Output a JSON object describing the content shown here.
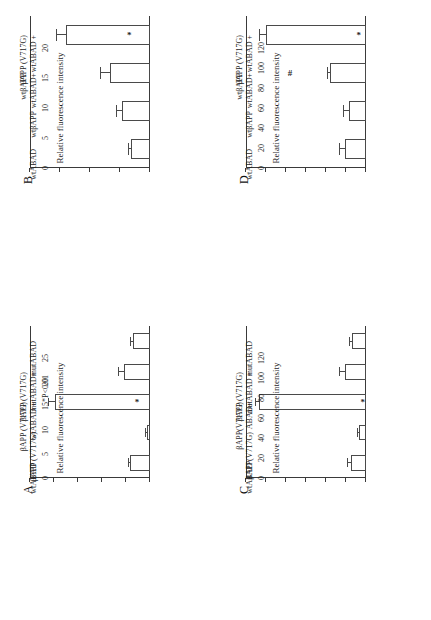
{
  "figure": {
    "orientation": "rotated-90",
    "ylabel": "Relative fluorescence intensity",
    "significance_note": "*P<0.01",
    "panel_letters": {
      "a": "A",
      "b": "B",
      "c": "C",
      "d": "D"
    }
  },
  "chart_data": [
    {
      "id": "A",
      "type": "bar",
      "title": "A",
      "xlabel": "",
      "ylabel": "Relative fluorescence intensity",
      "ylim": [
        0,
        25
      ],
      "yticks": [
        0,
        5,
        10,
        15,
        20,
        25
      ],
      "ytick_labels": [
        "0",
        "5",
        "10",
        "15",
        "20",
        "25"
      ],
      "grid": false,
      "legend": "none",
      "annotations": [
        "*P<0.01"
      ],
      "categories": [
        "wtABAD",
        "βAPP (V717G)",
        "wtABAD +\nβAPP (V717G)",
        "mutABAD+\nβAPP (V717G)",
        "mutABAD"
      ],
      "values": [
        4.2,
        0.7,
        19.8,
        5.4,
        3.6
      ],
      "errors": [
        0.25,
        0.2,
        1.2,
        1.0,
        0.35
      ],
      "markers": [
        "",
        "",
        "*",
        "",
        ""
      ]
    },
    {
      "id": "B",
      "type": "bar",
      "title": "B",
      "xlabel": "",
      "ylabel": "Relative fluorescence intensity",
      "ylim": [
        0,
        20
      ],
      "yticks": [
        0,
        5,
        10,
        15,
        20
      ],
      "ytick_labels": [
        "0",
        "5",
        "10",
        "15",
        "20"
      ],
      "grid": false,
      "legend": "none",
      "annotations": [],
      "categories": [
        "wtABAD",
        "wtβAPP",
        "wtABAD+\nwtβAPP",
        "wtABAD +\nβAPP (V717G)"
      ],
      "values": [
        3.2,
        4.6,
        6.6,
        14.0
      ],
      "errors": [
        0.25,
        0.9,
        1.6,
        1.5
      ],
      "markers": [
        "",
        "",
        "",
        "*"
      ]
    },
    {
      "id": "C",
      "type": "bar",
      "title": "C",
      "xlabel": "",
      "ylabel": "Relative fluorescence intensity",
      "ylim": [
        0,
        120
      ],
      "yticks": [
        0,
        20,
        40,
        60,
        80,
        100,
        120
      ],
      "ytick_labels": [
        "0",
        "20",
        "40",
        "60",
        "80",
        "100",
        "120"
      ],
      "grid": false,
      "legend": "none",
      "annotations": [],
      "categories": [
        "wtABAD",
        "βAPP(V717G)",
        "ABAD+\nβAPP(V717G)",
        "mutABAD +\nβAPP (V717G)",
        "mutABAD"
      ],
      "values": [
        15.0,
        7.5,
        107.0,
        21.5,
        14.0
      ],
      "errors": [
        3.5,
        0.8,
        3.5,
        5.0,
        1.8
      ],
      "markers": [
        "",
        "",
        "*",
        "",
        ""
      ]
    },
    {
      "id": "D",
      "type": "bar",
      "title": "D",
      "xlabel": "",
      "ylabel": "Relative fluorescence intensity",
      "ylim": [
        0,
        120
      ],
      "yticks": [
        0,
        20,
        40,
        60,
        80,
        100,
        120
      ],
      "ytick_labels": [
        "0",
        "20",
        "40",
        "60",
        "80",
        "100",
        "120"
      ],
      "grid": false,
      "legend": "none",
      "annotations": [],
      "categories": [
        "wtABAD",
        "wtβAPP",
        "wtABAD+\nwtβAPP",
        "wtABAD +\nβAPP (V717G)"
      ],
      "values": [
        21.0,
        17.5,
        36.5,
        100.0
      ],
      "errors": [
        5.5,
        4.5,
        1.2,
        6.5
      ],
      "markers": [
        "",
        "",
        "#",
        "*"
      ]
    }
  ]
}
